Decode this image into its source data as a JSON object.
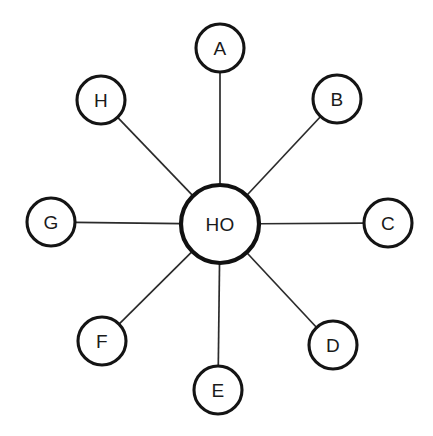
{
  "diagram": {
    "type": "star-topology",
    "background_color": "#ffffff",
    "canvas": {
      "width": 433,
      "height": 436
    },
    "hub": {
      "label": "HO",
      "center_x": 220,
      "center_y": 224,
      "radius": 39,
      "stroke_color": "#111111",
      "stroke_width": 4.2,
      "fill_color": "#ffffff"
    },
    "edge_style": {
      "stroke_color": "#2b2b2b",
      "stroke_width": 1.7
    },
    "node_style": {
      "radius": 24,
      "stroke_color": "#141414",
      "stroke_width": 3.1,
      "fill_color": "#ffffff"
    },
    "nodes": [
      {
        "label": "A",
        "center_x": 220,
        "center_y": 48,
        "radius": 24,
        "angle_deg": 90,
        "connected_to": "HO"
      },
      {
        "label": "B",
        "center_x": 337,
        "center_y": 99,
        "radius": 24,
        "angle_deg": 45,
        "connected_to": "HO"
      },
      {
        "label": "C",
        "center_x": 388,
        "center_y": 223,
        "radius": 24,
        "angle_deg": 0,
        "connected_to": "HO"
      },
      {
        "label": "D",
        "center_x": 333,
        "center_y": 345,
        "radius": 24,
        "angle_deg": 315,
        "connected_to": "HO"
      },
      {
        "label": "E",
        "center_x": 218,
        "center_y": 390,
        "radius": 24,
        "angle_deg": 270,
        "connected_to": "HO"
      },
      {
        "label": "F",
        "center_x": 102,
        "center_y": 341,
        "radius": 24,
        "angle_deg": 225,
        "connected_to": "HO"
      },
      {
        "label": "G",
        "center_x": 51,
        "center_y": 222,
        "radius": 24,
        "angle_deg": 180,
        "connected_to": "HO"
      },
      {
        "label": "H",
        "center_x": 101,
        "center_y": 100,
        "radius": 24,
        "angle_deg": 135,
        "connected_to": "HO"
      }
    ]
  }
}
